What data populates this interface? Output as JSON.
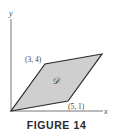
{
  "figure": {
    "caption": "FIGURE 14",
    "axes": {
      "x_label": "x",
      "y_label": "y"
    },
    "region": {
      "label": "𝒟",
      "fill": "#cfcfcf",
      "stroke": "#2a2a2a"
    },
    "vertices": [
      {
        "coords": [
          0,
          0
        ],
        "label": ""
      },
      {
        "coords": [
          5,
          1
        ],
        "label": "(5, 1)"
      },
      {
        "coords": [
          8,
          5
        ],
        "label": ""
      },
      {
        "coords": [
          3,
          4
        ],
        "label": "(3, 4)"
      }
    ],
    "point_labels": {
      "top_left": "(3, 4)",
      "bottom_right": "(5, 1)"
    }
  }
}
